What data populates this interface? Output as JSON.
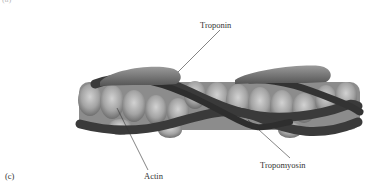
{
  "figure": {
    "panel_letter_top": "(a)",
    "panel_letter": "(c)",
    "labels": {
      "troponin": "Troponin",
      "actin": "Actin",
      "tropomyosin": "Tropomyosin"
    },
    "colors": {
      "actin_light": "#b8b8b8",
      "actin_mid": "#8a8a8a",
      "tropomyosin": "#3c3c3c",
      "troponin": "#7a7a7a",
      "leader_line": "#333333"
    }
  }
}
